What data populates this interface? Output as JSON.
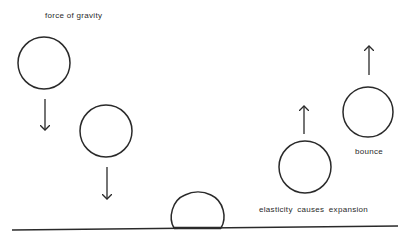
{
  "diagram": {
    "type": "ball-bounce-physics",
    "colors": {
      "stroke": "#2a2a2a",
      "background": "#ffffff"
    },
    "labels": {
      "gravity": "force of gravity",
      "bounce": "bounce",
      "elasticity": "elasticity causes expansion"
    },
    "stages": [
      {
        "id": "falling-1",
        "shape": "circle",
        "cx": 44,
        "cy": 63,
        "r": 26,
        "arrow": "down"
      },
      {
        "id": "falling-2",
        "shape": "circle",
        "cx": 106,
        "cy": 131,
        "r": 26,
        "arrow": "down"
      },
      {
        "id": "impact",
        "shape": "squashed-ball",
        "x1": 172,
        "x2": 223,
        "top": 193,
        "bottom": 228
      },
      {
        "id": "expanding",
        "shape": "circle",
        "cx": 305,
        "cy": 167,
        "r": 26,
        "arrow": "up"
      },
      {
        "id": "bouncing",
        "shape": "circle",
        "cx": 368,
        "cy": 112,
        "r": 25,
        "arrow": "up"
      }
    ],
    "ground": {
      "x1": 12,
      "y1": 230,
      "x2": 398,
      "y2": 226
    }
  }
}
